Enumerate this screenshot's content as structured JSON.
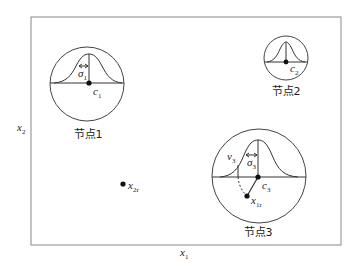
{
  "diagram": {
    "axes": {
      "x_label": "x",
      "x_sub": "1",
      "y_label": "x",
      "y_sub": "2"
    },
    "nodes": [
      {
        "label": "节点1",
        "center": "c",
        "center_sub": "1",
        "sigma": "σ",
        "sigma_sub": "1"
      },
      {
        "label": "节点2",
        "center": "c",
        "center_sub": "2"
      },
      {
        "label": "节点3",
        "center": "c",
        "center_sub": "3",
        "sigma": "σ",
        "sigma_sub": "3",
        "nu": "v",
        "nu_sub": "3",
        "point": "x",
        "point_sub": "1r"
      }
    ],
    "points": [
      {
        "label": "x",
        "sub": "2r"
      }
    ],
    "colors": {
      "stroke": "#333333",
      "frame": "#888888",
      "text": "#222222"
    }
  }
}
